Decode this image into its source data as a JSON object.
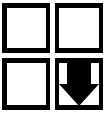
{
  "figure": {
    "background_color": "#ffffff",
    "stroke_color": "#000000",
    "fill_color": "#000000",
    "width": 106,
    "height": 115
  },
  "grid": {
    "rows": 2,
    "columns": 2,
    "cells": [
      {
        "position": "top-left",
        "shape": "square",
        "outline_color": "#000000",
        "fill": "#ffffff",
        "content": "empty",
        "label": ""
      },
      {
        "position": "top-right",
        "shape": "square",
        "outline_color": "#000000",
        "fill": "#ffffff",
        "content": "empty",
        "label": ""
      },
      {
        "position": "bottom-left",
        "shape": "square",
        "outline_color": "#000000",
        "fill": "#ffffff",
        "content": "empty",
        "label": ""
      },
      {
        "position": "bottom-right",
        "shape": "square",
        "outline_color": "#000000",
        "fill": "#ffffff",
        "content": "down-arrow",
        "icon": "arrow-down-icon",
        "icon_fill": "#000000",
        "label": ""
      }
    ]
  }
}
